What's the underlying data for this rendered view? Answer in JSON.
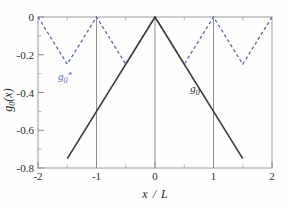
{
  "figure": {
    "background_color": "#fefefe",
    "width": 286,
    "height": 208
  },
  "chart_data": {
    "type": "line",
    "title": "",
    "subtitle": "",
    "xlabel": "x / L",
    "ylabel": "g0(x)",
    "xlim": [
      -2,
      2
    ],
    "ylim": [
      -0.8,
      0
    ],
    "xticks": [
      -2,
      -1,
      0,
      1,
      2
    ],
    "xticklabels": [
      "-2",
      "-1",
      "0",
      "1",
      "2"
    ],
    "yticks": [
      0,
      -0.2,
      -0.4,
      -0.6,
      -0.8
    ],
    "yticklabels": [
      "0",
      "-0.2",
      "-0.4",
      "-0.6",
      "-0.8"
    ],
    "x_minor_ticks": [
      -1.5,
      -0.5,
      0.5,
      1.5
    ],
    "y_minor_ticks": [
      -0.1,
      -0.3,
      -0.5,
      -0.7
    ],
    "grid": false,
    "vertical_rules_at_x": [
      -1,
      0,
      1
    ],
    "legend_position": "inline-annotations",
    "series": [
      {
        "name": "g0",
        "label": "g0",
        "label_display": "g",
        "label_sub": "0",
        "label_sup": "",
        "color": "#3a3a3a",
        "linestyle": "solid",
        "x": [
          -1.5,
          0,
          1.5
        ],
        "y": [
          -0.75,
          0,
          -0.75
        ],
        "annotation": {
          "x": 0.72,
          "y": -0.365
        }
      },
      {
        "name": "g0star",
        "label": "g0*",
        "label_display": "g",
        "label_sub": "0",
        "label_sup": "*",
        "color": "#5566b8",
        "linestyle": "dashed",
        "x": [
          -2,
          -1.5,
          -1,
          -0.5,
          0,
          0.5,
          1,
          1.5,
          2
        ],
        "y": [
          0,
          -0.25,
          0,
          -0.25,
          0,
          -0.25,
          0,
          -0.25,
          0
        ],
        "annotation": {
          "x": -1.42,
          "y": -0.3
        }
      }
    ]
  },
  "axis_labels": {
    "x_axis_title": "x / L",
    "x_axis_title_parts": {
      "variable": "x",
      "slash": "/",
      "denominator": "L"
    },
    "y_axis_title": "g0(x)",
    "y_axis_title_parts": {
      "symbol": "g",
      "subscript": "0",
      "argument": "(x)"
    }
  },
  "tick_text": {
    "x": [
      "-2",
      "-1",
      "0",
      "1",
      "2"
    ],
    "y": [
      "0",
      "-0.2",
      "-0.4",
      "-0.6",
      "-0.8"
    ]
  },
  "colors": {
    "solid_series": "#3a3a3a",
    "dashed_series": "#5566b8",
    "axis": "#8a8a8a",
    "text": "#1f1f1f"
  }
}
